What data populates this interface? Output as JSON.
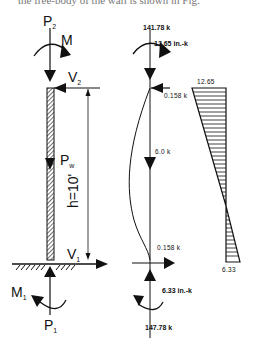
{
  "caption_fragment": "the free-body of the wall is shown in Fig.",
  "left_diagram": {
    "labels": {
      "top_axial": "P",
      "top_axial_sub": "2",
      "top_moment": "M",
      "top_shear": "V",
      "top_shear_sub": "2",
      "self_weight": "P",
      "self_weight_sub": "w",
      "height": "h=10'",
      "bottom_shear": "V",
      "bottom_shear_sub": "1",
      "bottom_moment": "M",
      "bottom_moment_sub": "1",
      "bottom_axial": "P",
      "bottom_axial_sub": "1"
    }
  },
  "middle_diagram": {
    "labels": {
      "top_axial": "141.78 k",
      "top_moment": "12.65 in.-k",
      "top_shear": "0.158 k",
      "self_weight": "6.0 k",
      "bottom_shear": "0.158 k",
      "bottom_moment": "6.33 in.-k",
      "bottom_axial": "147.78 k"
    }
  },
  "moment_diagram": {
    "labels": {
      "top_value": "12.65",
      "bottom_value": "6.33"
    },
    "values": {
      "top": 12.65,
      "bottom": -6.33
    }
  }
}
